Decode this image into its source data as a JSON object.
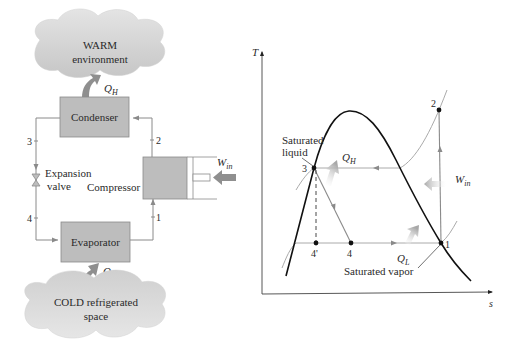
{
  "colors": {
    "box_fill": "#bdbdbd",
    "box_stroke": "#7a7a7a",
    "line": "#8a8a8a",
    "dome": "#111111",
    "isobar": "#9a9a9a",
    "arrow": "#9b9b9b",
    "cloud_top": "#e3e3e3",
    "cloud_bottom": "#c8c8c8"
  },
  "cycle_schematic": {
    "warm_cloud": {
      "line1": "WARM",
      "line2": "environment"
    },
    "cold_cloud": {
      "line1": "COLD refrigerated",
      "line2": "space"
    },
    "condenser": {
      "label": "Condenser"
    },
    "evaporator": {
      "label": "Evaporator"
    },
    "compressor": {
      "label": "Compressor"
    },
    "expansion_valve": {
      "line1": "Expansion",
      "line2": "valve"
    },
    "heat_out": {
      "symbol": "Q",
      "subscript": "H"
    },
    "heat_in": {
      "symbol": "Q",
      "subscript": "L"
    },
    "work_in": {
      "symbol": "W",
      "subscript": "in"
    },
    "state_points": [
      "1",
      "2",
      "3",
      "4"
    ]
  },
  "ts_diagram": {
    "axis_y_label": "T",
    "axis_x_label": "s",
    "saturated_liquid_label": [
      "Saturated",
      "liquid"
    ],
    "saturated_vapor_label": "Saturated vapor",
    "heat_out": {
      "symbol": "Q",
      "subscript": "H"
    },
    "heat_in": {
      "symbol": "Q",
      "subscript": "L"
    },
    "work_in": {
      "symbol": "W",
      "subscript": "in"
    },
    "points": [
      {
        "id": "1",
        "label": "1",
        "x": 441,
        "y": 243
      },
      {
        "id": "2",
        "label": "2",
        "x": 439,
        "y": 110
      },
      {
        "id": "3",
        "label": "3",
        "x": 314,
        "y": 168
      },
      {
        "id": "4",
        "label": "4",
        "x": 351,
        "y": 243
      },
      {
        "id": "4p",
        "label": "4'",
        "x": 316,
        "y": 243
      }
    ]
  }
}
